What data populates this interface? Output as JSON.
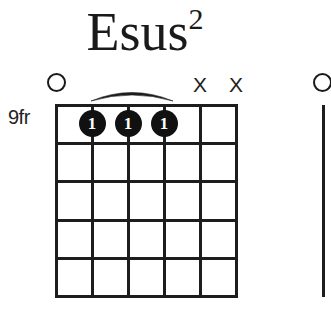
{
  "chord": {
    "name": "Esus",
    "extension": "2",
    "full_label": "Esus2",
    "position_label": "9fr",
    "start_fret": 9,
    "strings": 6,
    "frets": 5,
    "barre": {
      "present": true,
      "from_string": 2,
      "to_string": 4,
      "fret": 1,
      "finger": "1"
    },
    "string_markers": [
      {
        "string": 1,
        "type": "open",
        "symbol": "O"
      },
      {
        "string": 2,
        "type": "none",
        "symbol": ""
      },
      {
        "string": 3,
        "type": "none",
        "symbol": ""
      },
      {
        "string": 4,
        "type": "none",
        "symbol": ""
      },
      {
        "string": 5,
        "type": "muted",
        "symbol": "X"
      },
      {
        "string": 6,
        "type": "muted",
        "symbol": "X"
      }
    ],
    "dots": [
      {
        "string": 2,
        "fret": 1,
        "finger": "1"
      },
      {
        "string": 3,
        "fret": 1,
        "finger": "1"
      },
      {
        "string": 4,
        "fret": 1,
        "finger": "1"
      }
    ]
  },
  "next_chord": {
    "visible_partial": true,
    "open_marker_symbol": "O"
  },
  "colors": {
    "ink": "#1d1d1d",
    "dot_fill": "#111111",
    "dot_text": "#ffffff",
    "background": "#ffffff"
  }
}
